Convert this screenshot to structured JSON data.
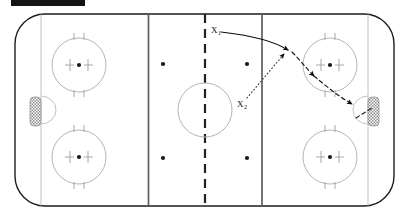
{
  "title_bar": {
    "name": "black-title-bar",
    "color": "#141414",
    "label": ""
  },
  "diagram": {
    "kind": "ice-hockey-rink-play-diagram",
    "orientation": "horizontal",
    "colors": {
      "ice": "#ffffff",
      "board": "#1d1d1d",
      "line_light": "#bdbdbd",
      "blue_line": "#6a6a6a",
      "red_line": "#2a2a2a",
      "circle": "#b5b5b5",
      "arrow": "#0c0c0c",
      "net_fill": "#9a9a9a",
      "label": "#111111"
    },
    "players": [
      {
        "id": "x1",
        "label": "X",
        "sub": "1",
        "x": 211,
        "y": 26
      },
      {
        "id": "x2",
        "label": "X",
        "sub": "2",
        "x": 237,
        "y": 100
      }
    ],
    "routes": [
      {
        "id": "x1-skate-route",
        "style": "solid",
        "desc": "X1 curved skating path from neutral zone to attacking zone"
      },
      {
        "id": "x2-pass-route",
        "style": "dotted",
        "desc": "X2 pass up ice to X1 receiving point"
      },
      {
        "id": "x1-carry-route",
        "style": "dashed",
        "desc": "puck carried through faceoff circle to the net"
      }
    ],
    "markings": {
      "faceoff_circles": 4,
      "center_circle": 1,
      "neutral_zone_dots": 2,
      "goal_nets": 2,
      "blue_lines": 2,
      "goal_lines": 2,
      "center_red_line": 1
    }
  }
}
